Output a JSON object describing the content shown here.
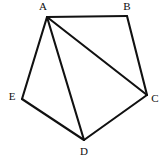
{
  "figure": {
    "kind": "geometry-diagram",
    "shape_name": "pentagon ABCDE with diagonals",
    "canvas": {
      "width": 165,
      "height": 158,
      "background": "#ffffff"
    },
    "stroke": {
      "color": "#111111",
      "width": 2.1
    },
    "label_color": "#0d0d0d",
    "vertices": [
      {
        "id": "A",
        "label": "A",
        "x": 47,
        "y": 17,
        "label_x": 43,
        "label_y": 6
      },
      {
        "id": "B",
        "label": "B",
        "x": 127,
        "y": 16,
        "label_x": 127,
        "label_y": 6
      },
      {
        "id": "C",
        "label": "C",
        "x": 147,
        "y": 95,
        "label_x": 155,
        "label_y": 98
      },
      {
        "id": "D",
        "label": "D",
        "x": 84,
        "y": 140,
        "label_x": 84,
        "label_y": 151
      },
      {
        "id": "E",
        "label": "E",
        "x": 22,
        "y": 99,
        "label_x": 12,
        "label_y": 96
      }
    ],
    "edges": [
      {
        "id": "AB",
        "from": "A",
        "to": "B",
        "kind": "side",
        "x1": 47,
        "y1": 17,
        "x2": 127,
        "y2": 16
      },
      {
        "id": "BC",
        "from": "B",
        "to": "C",
        "kind": "side",
        "x1": 127,
        "y1": 16,
        "x2": 147,
        "y2": 95
      },
      {
        "id": "CD",
        "from": "C",
        "to": "D",
        "kind": "side",
        "x1": 147,
        "y1": 95,
        "x2": 84,
        "y2": 140
      },
      {
        "id": "DE",
        "from": "D",
        "to": "E",
        "kind": "side",
        "x1": 84,
        "y1": 140,
        "x2": 22,
        "y2": 99
      },
      {
        "id": "EA",
        "from": "E",
        "to": "A",
        "kind": "side",
        "x1": 22,
        "y1": 99,
        "x2": 47,
        "y2": 17
      },
      {
        "id": "AC",
        "from": "A",
        "to": "C",
        "kind": "diagonal",
        "x1": 47,
        "y1": 17,
        "x2": 147,
        "y2": 95
      },
      {
        "id": "AD",
        "from": "A",
        "to": "D",
        "kind": "diagonal",
        "x1": 47,
        "y1": 17,
        "x2": 84,
        "y2": 140
      }
    ]
  }
}
